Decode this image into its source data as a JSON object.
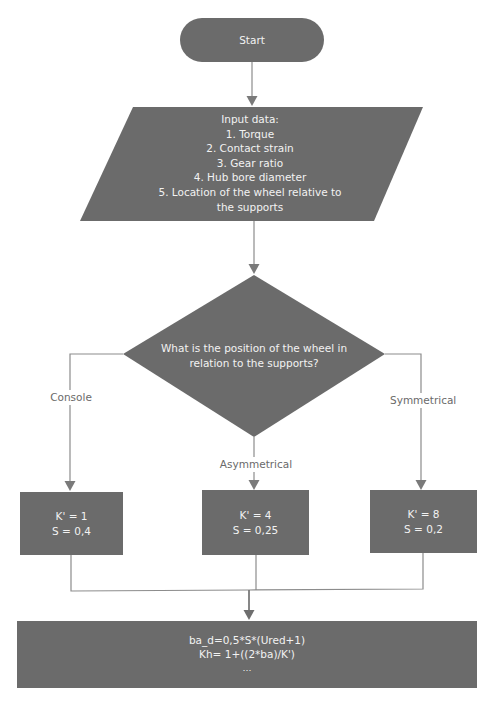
{
  "colors": {
    "node_fill": "#6b6b6b",
    "connector": "#8c8c8c",
    "node_text": "#f2f2f2",
    "label_text": "#6a6a6a",
    "background": "#ffffff"
  },
  "nodes": {
    "start": {
      "shape": "terminator",
      "label": "Start"
    },
    "input": {
      "shape": "parallelogram",
      "lines": [
        "Input data:",
        "1. Torque",
        "2. Contact strain",
        "3. Gear ratio",
        "4. Hub bore diameter",
        "5. Location of the wheel relative to",
        "the supports"
      ]
    },
    "decision": {
      "shape": "diamond",
      "lines": [
        "What is the position of the wheel in",
        "relation to the supports?"
      ]
    },
    "console_box": {
      "shape": "process",
      "lines": [
        "K' = 1",
        "S = 0,4"
      ]
    },
    "asymmetrical_box": {
      "shape": "process",
      "lines": [
        "K' = 4",
        "S = 0,25"
      ]
    },
    "symmetrical_box": {
      "shape": "process",
      "lines": [
        "K' = 8",
        "S = 0,2"
      ]
    },
    "calc": {
      "shape": "process",
      "lines": [
        "ba_d=0,5*S*(Ured+1)",
        "Kh= 1+((2*ba)/K')",
        "…"
      ]
    }
  },
  "edges": {
    "console": {
      "label": "Console"
    },
    "asymmetrical": {
      "label": "Asymmetrical"
    },
    "symmetrical": {
      "label": "Symmetrical"
    }
  }
}
